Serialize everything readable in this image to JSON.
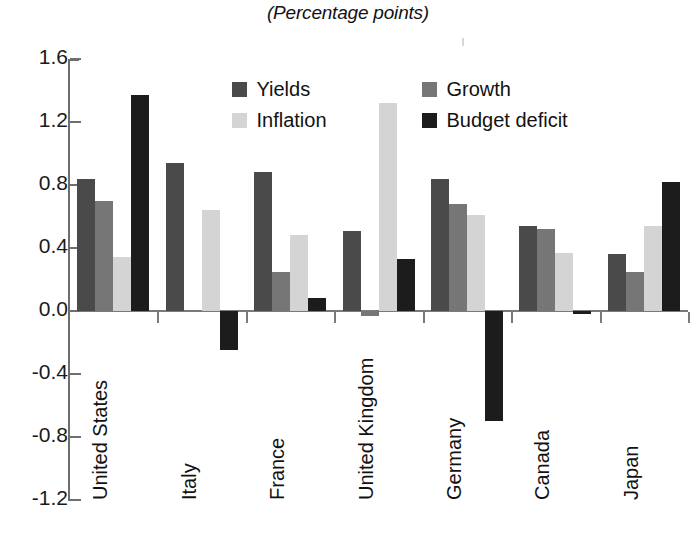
{
  "chart_data": {
    "type": "bar",
    "title": "(Percentage points)",
    "subtitle": "",
    "xlabel": "",
    "ylabel": "",
    "ylim": [
      -1.2,
      1.6
    ],
    "ytick_labels": [
      "1.6",
      "1.2",
      "0.8",
      "0.4",
      "0.0",
      "-0.4",
      "-0.8",
      "-1.2"
    ],
    "ytick_values": [
      1.6,
      1.2,
      0.8,
      0.4,
      0.0,
      -0.4,
      -0.8,
      -1.2
    ],
    "grid": false,
    "legend_position": "inside-top-center",
    "categories": [
      "United States",
      "Italy",
      "France",
      "United Kingdom",
      "Germany",
      "Canada",
      "Japan"
    ],
    "series": [
      {
        "name": "Yields",
        "color": "#4a4a4a",
        "values": [
          0.84,
          0.94,
          0.88,
          0.51,
          0.84,
          0.54,
          0.36
        ]
      },
      {
        "name": "Growth",
        "color": "#767676",
        "values": [
          0.7,
          0.0,
          0.25,
          -0.03,
          0.68,
          0.52,
          0.25
        ]
      },
      {
        "name": "Inflation",
        "color": "#d4d4d4",
        "values": [
          0.34,
          0.64,
          0.48,
          1.32,
          0.61,
          0.37,
          0.54
        ]
      },
      {
        "name": "Budget deficit",
        "color": "#1c1c1c",
        "values": [
          1.37,
          -0.25,
          0.08,
          0.33,
          -0.7,
          -0.02,
          0.82
        ]
      }
    ]
  },
  "legend": {
    "items": [
      {
        "label": "Yields",
        "color": "#4a4a4a"
      },
      {
        "label": "Inflation",
        "color": "#d4d4d4"
      },
      {
        "label": "Growth",
        "color": "#767676"
      },
      {
        "label": "Budget deficit",
        "color": "#1c1c1c"
      }
    ]
  },
  "colors": {
    "yields": "#4a4a4a",
    "growth": "#767676",
    "inflation": "#d4d4d4",
    "budget_deficit": "#1c1c1c",
    "axis": "#6e6e6e",
    "text": "#121212",
    "background": "#ffffff"
  }
}
